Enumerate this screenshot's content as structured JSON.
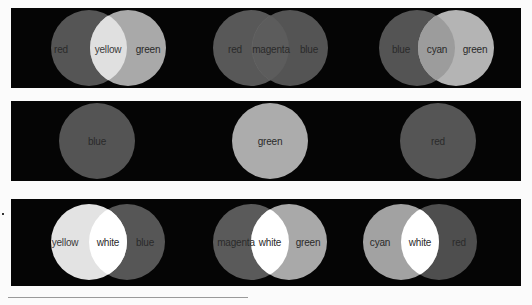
{
  "panels": {
    "top": {
      "groups": [
        {
          "left": "red",
          "middle": "yellow",
          "right": "green"
        },
        {
          "left": "red",
          "middle": "magenta",
          "right": "blue"
        },
        {
          "left": "blue",
          "middle": "cyan",
          "right": "green"
        }
      ]
    },
    "middle": {
      "circles": [
        "blue",
        "green",
        "red"
      ]
    },
    "bottom": {
      "groups": [
        {
          "left": "yellow",
          "middle": "white",
          "right": "blue"
        },
        {
          "left": "magenta",
          "middle": "white",
          "right": "green"
        },
        {
          "left": "cyan",
          "middle": "white",
          "right": "red"
        }
      ]
    }
  },
  "colors": {
    "background": "#050505",
    "red": "#555555",
    "green": "#a9a9a9",
    "blue": "#555555",
    "yellow": "#dedede",
    "magenta": "#5a5a5a",
    "cyan": "#9c9c9c",
    "white": "#ffffff"
  }
}
